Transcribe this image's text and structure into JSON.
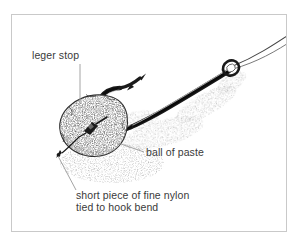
{
  "figure": {
    "kind": "pen-and-ink fishing rig illustration",
    "background_color": "#ffffff",
    "frame_color": "#c9c9c9",
    "ink_color": "#1a1a1a",
    "leader_line_color": "#8c8c8c",
    "text_color": "#3a3a3a"
  },
  "labels": {
    "leger_stop": "leger stop",
    "ball_of_paste": "ball of paste",
    "nylon_line_1": "short piece of fine nylon",
    "nylon_line_2": "tied to hook bend"
  },
  "bottom_caption": {
    "text": ""
  },
  "parts": [
    {
      "name": "fishing-line",
      "description": "mono line entering from top-right corner, threaded through hook eye"
    },
    {
      "name": "hook-eye",
      "description": "small ring at top of shank"
    },
    {
      "name": "hook-shank",
      "description": "tapered dark shank sloping down-left from eye"
    },
    {
      "name": "hook-bend",
      "description": "U-shaped bend at lower left of shank"
    },
    {
      "name": "hook-point",
      "description": "barbed point angled up-left from the bend"
    },
    {
      "name": "paste-ball",
      "description": "stippled round ball of paste moulded over the bend"
    },
    {
      "name": "leger-stop",
      "description": "small dark stop embedded in the centre of the paste ball"
    },
    {
      "name": "nylon-stub",
      "description": "short nylon stub exiting the lower-left of the paste ball"
    },
    {
      "name": "ground-shadow",
      "description": "stippled shadow cast below the hook and paste ball"
    }
  ]
}
